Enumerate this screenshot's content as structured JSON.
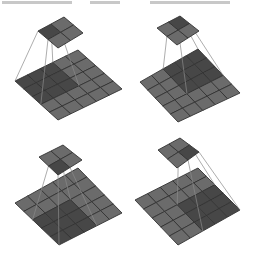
{
  "diagram": {
    "title": "",
    "colors": {
      "background": "#ffffff",
      "cell": "#6b6b6b",
      "cell_highlight": "#474747",
      "grid_line": "#333333",
      "projection_line": "#8a8a8a",
      "output_cell": "#6b6b6b",
      "output_highlight": "#474747"
    },
    "input_grid_size": 5,
    "kernel_size": 3,
    "output_grid_size": 2,
    "panels": [
      {
        "id": "panel-1",
        "output_index": [
          0,
          0
        ],
        "receptive_field_origin": [
          0,
          0
        ],
        "output": {
          "left": [
            38,
            31
          ],
          "top": [
            64,
            17
          ],
          "right": [
            83,
            33
          ],
          "bottom": [
            58,
            48
          ]
        },
        "input": {
          "left": [
            15,
            81
          ],
          "top": [
            78,
            50
          ],
          "right": [
            122,
            89
          ],
          "bottom": [
            58,
            120
          ]
        }
      },
      {
        "id": "panel-2",
        "output_index": [
          0,
          1
        ],
        "receptive_field_origin": [
          0,
          2
        ],
        "output": {
          "left": [
            157,
            28
          ],
          "top": [
            180,
            16
          ],
          "right": [
            199,
            31
          ],
          "bottom": [
            177,
            45
          ]
        },
        "input": {
          "left": [
            140,
            82
          ],
          "top": [
            198,
            49
          ],
          "right": [
            240,
            93
          ],
          "bottom": [
            178,
            122
          ]
        }
      },
      {
        "id": "panel-3",
        "output_index": [
          1,
          0
        ],
        "receptive_field_origin": [
          2,
          0
        ],
        "output": {
          "left": [
            39,
            157
          ],
          "top": [
            63,
            145
          ],
          "right": [
            82,
            160
          ],
          "bottom": [
            58,
            175
          ]
        },
        "input": {
          "left": [
            15,
            203
          ],
          "top": [
            78,
            168
          ],
          "right": [
            122,
            213
          ],
          "bottom": [
            59,
            245
          ]
        }
      },
      {
        "id": "panel-4",
        "output_index": [
          1,
          1
        ],
        "receptive_field_origin": [
          2,
          2
        ],
        "output": {
          "left": [
            158,
            150
          ],
          "top": [
            180,
            138
          ],
          "right": [
            199,
            152
          ],
          "bottom": [
            177,
            168
          ]
        },
        "input": {
          "left": [
            135,
            200
          ],
          "top": [
            198,
            168
          ],
          "right": [
            240,
            210
          ],
          "bottom": [
            178,
            245
          ]
        }
      }
    ]
  }
}
